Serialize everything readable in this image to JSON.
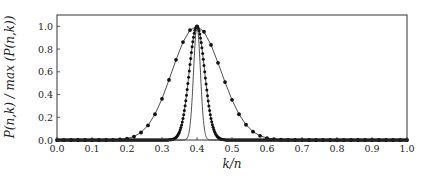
{
  "chart_data": {
    "type": "line",
    "title": "",
    "xlabel": "k/n",
    "ylabel": "P(n,k) / max (P(n,k))",
    "xlim": [
      0.0,
      1.0
    ],
    "ylim": [
      0.0,
      1.1
    ],
    "grid": false,
    "legend": null,
    "x_ticks": [
      "0.0",
      "0.1",
      "0.2",
      "0.3",
      "0.4",
      "0.5",
      "0.6",
      "0.7",
      "0.8",
      "0.9",
      "1.0"
    ],
    "y_ticks": [
      "0.0",
      "0.2",
      "0.4",
      "0.6",
      "0.8",
      "1.0"
    ],
    "peak_x": 0.4,
    "series": [
      {
        "name": "wide (markers)",
        "n": 50,
        "p": 0.4,
        "markers": true,
        "marker_step": 1
      },
      {
        "name": "narrow (dense markers)",
        "n": 500,
        "p": 0.4,
        "markers": true,
        "marker_step": 1
      },
      {
        "name": "very narrow (line only)",
        "n": 2500,
        "p": 0.4,
        "markers": false
      }
    ],
    "colors": {
      "line": "#222222",
      "marker": "#111111",
      "frame": "#333333"
    }
  }
}
